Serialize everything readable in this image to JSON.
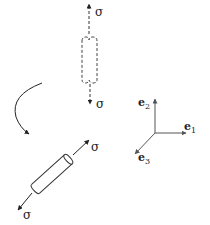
{
  "figure": {
    "colors": {
      "line": "#222222",
      "axes": "#555555",
      "dashed": "#444444"
    }
  },
  "vertical_fiber": {
    "style": "dashed",
    "top_load_label": "σ",
    "bottom_load_label": "σ"
  },
  "rotation_arrow": {
    "direction": "counterclockwise-down"
  },
  "rotated_fiber": {
    "style": "solid",
    "upper_load_label": "σ",
    "lower_load_label": "σ"
  },
  "axes": {
    "e1": {
      "symbol": "e",
      "subscript": "1"
    },
    "e2": {
      "symbol": "e",
      "subscript": "2"
    },
    "e3": {
      "symbol": "e",
      "subscript": "3"
    }
  }
}
